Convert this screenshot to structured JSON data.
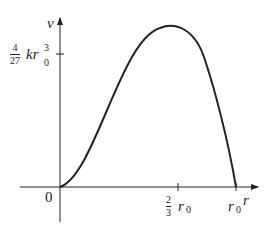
{
  "diagram": {
    "y_axis_label": "v",
    "x_axis_label": "r",
    "origin_label": "0",
    "y_tick": {
      "num": "4",
      "den": "27",
      "expr": "kr",
      "sub": "0",
      "sup": "3"
    },
    "x_ticks": [
      {
        "num": "2",
        "den": "3",
        "expr": "r",
        "sub": "0"
      },
      {
        "expr": "r",
        "sub": "0"
      }
    ],
    "curve": "v = k r^2 (r0 - r)",
    "colors": {
      "ink": "#222222"
    }
  }
}
